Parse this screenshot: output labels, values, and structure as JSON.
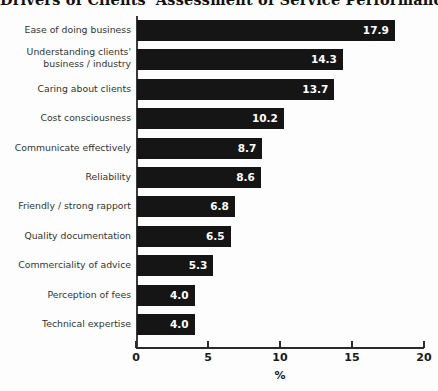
{
  "chart_data": {
    "type": "bar",
    "orientation": "horizontal",
    "title": "Drivers of Clients' Assessment of Service Performance",
    "xlabel": "%",
    "ylabel": "",
    "xlim": [
      0,
      20
    ],
    "xticks": [
      0,
      5,
      10,
      15,
      20
    ],
    "xtick_labels": [
      "0",
      "5",
      "10",
      "15",
      "20"
    ],
    "grid": false,
    "legend": null,
    "bar_color": "#151515",
    "value_label_color": "#ffffff",
    "categories": [
      "Ease of doing business",
      "Understanding clients'\nbusiness / industry",
      "Caring about clients",
      "Cost consciousness",
      "Communicate effectively",
      "Reliability",
      "Friendly / strong rapport",
      "Quality documentation",
      "Commerciality of advice",
      "Perception of fees",
      "Technical expertise"
    ],
    "values": [
      17.9,
      14.3,
      13.7,
      10.2,
      8.7,
      8.6,
      6.8,
      6.5,
      5.3,
      4.0,
      4.0
    ],
    "value_labels": [
      "17.9",
      "14.3",
      "13.7",
      "10.2",
      "8.7",
      "8.6",
      "6.8",
      "6.5",
      "5.3",
      "4.0",
      "4.0"
    ]
  }
}
